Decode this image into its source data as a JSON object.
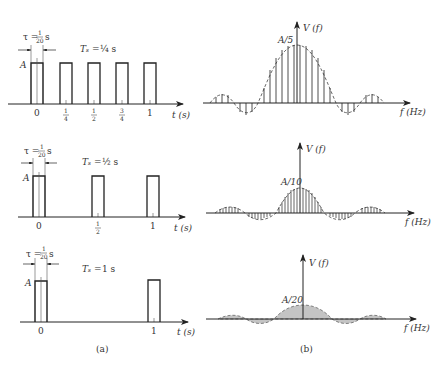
{
  "figure": {
    "panel_a_caption": "(a)",
    "panel_b_caption": "(b)",
    "rows": [
      {
        "tau_label": "τ = 1/20 s",
        "tau_lhs": "τ =",
        "tau_num": "1",
        "tau_den": "20",
        "tau_unit": "s",
        "period_label": "Tₛ = ¼ s",
        "period_lhs": "Tₛ =",
        "period_value": "¼ s",
        "amplitude_label": "A",
        "time_ticks": [
          "0",
          "1/4",
          "1/2",
          "3/4",
          "1"
        ],
        "time_axis_label": "t (s)",
        "spectrum_peak_label": "A/5",
        "spectrum_y_label": "V (f)",
        "spectrum_x_label": "f (Hz)",
        "spectrum_style": "discrete lines"
      },
      {
        "tau_label": "τ = 1/20 s",
        "tau_lhs": "τ =",
        "tau_num": "1",
        "tau_den": "20",
        "tau_unit": "s",
        "period_label": "Tₛ = ½ s",
        "period_lhs": "Tₛ =",
        "period_value": "½ s",
        "amplitude_label": "A",
        "time_ticks": [
          "0",
          "1/2",
          "1"
        ],
        "time_axis_label": "t (s)",
        "spectrum_peak_label": "A/10",
        "spectrum_y_label": "V (f)",
        "spectrum_x_label": "f (Hz)",
        "spectrum_style": "discrete lines (denser)"
      },
      {
        "tau_label": "τ = 1/20 s",
        "tau_lhs": "τ =",
        "tau_num": "1",
        "tau_den": "20",
        "tau_unit": "s",
        "period_label": "Tₛ = 1 s",
        "period_lhs": "Tₛ =",
        "period_value": "1 s",
        "amplitude_label": "A",
        "time_ticks": [
          "0",
          "1"
        ],
        "time_axis_label": "t (s)",
        "spectrum_peak_label": "A/20",
        "spectrum_y_label": "V (f)",
        "spectrum_x_label": "f (Hz)",
        "spectrum_style": "filled continuous envelope"
      }
    ],
    "colors": {
      "ink": "#222222",
      "fill": "#bdbdbd",
      "background": "#ffffff"
    }
  }
}
